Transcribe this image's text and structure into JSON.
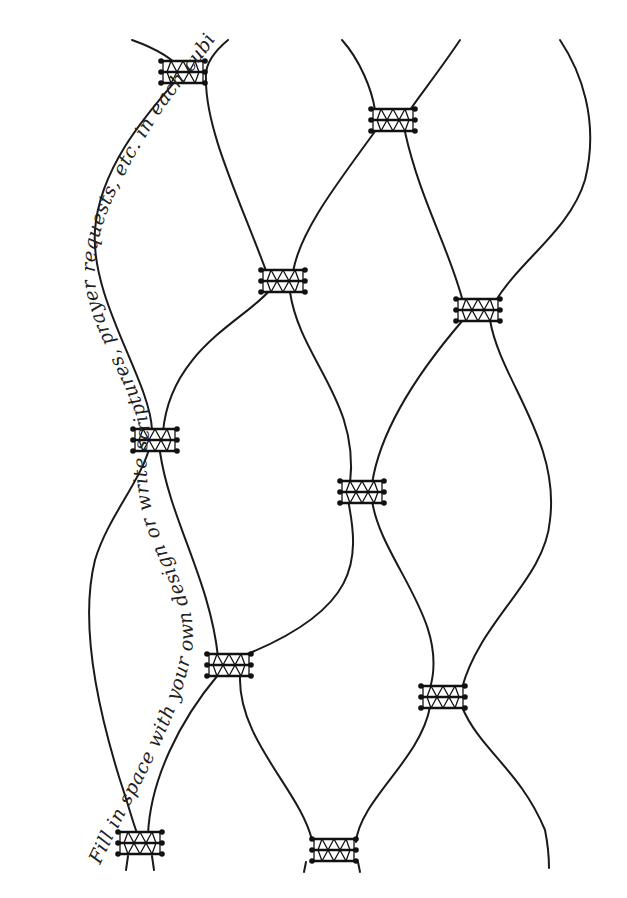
{
  "page": {
    "background": "#ffffff",
    "ink_color": "#1a1a1a"
  },
  "handwriting": {
    "text": "Fill in space with your own design or write scriptures, prayer requests, etc. in each cubicle"
  },
  "knots": [
    {
      "id": "k1",
      "x": 183,
      "y": 72
    },
    {
      "id": "k2",
      "x": 393,
      "y": 120
    },
    {
      "id": "k3",
      "x": 283,
      "y": 281
    },
    {
      "id": "k4",
      "x": 478,
      "y": 310
    },
    {
      "id": "k5",
      "x": 155,
      "y": 440
    },
    {
      "id": "k6",
      "x": 362,
      "y": 492
    },
    {
      "id": "k7",
      "x": 229,
      "y": 665
    },
    {
      "id": "k8",
      "x": 443,
      "y": 697
    },
    {
      "id": "k9",
      "x": 140,
      "y": 843
    },
    {
      "id": "k10",
      "x": 334,
      "y": 850
    }
  ]
}
